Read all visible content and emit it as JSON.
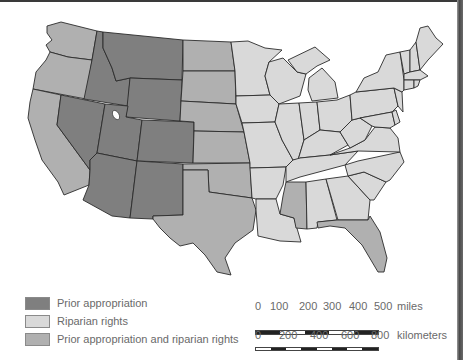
{
  "map": {
    "title": "Water rights doctrines of the United States",
    "colors": {
      "prior_appropriation": "#7f7f7f",
      "riparian_rights": "#d9d9d9",
      "mixed": "#b0b0b0",
      "border": "#2b2b2b"
    },
    "categories": {
      "prior_appropriation": [
        "Montana",
        "Idaho",
        "Wyoming",
        "Nevada",
        "Utah",
        "Colorado",
        "Arizona",
        "New Mexico"
      ],
      "mixed": [
        "Washington",
        "Oregon",
        "California",
        "North Dakota",
        "South Dakota",
        "Nebraska",
        "Kansas",
        "Oklahoma",
        "Texas",
        "Mississippi",
        "Florida"
      ],
      "riparian_rights": [
        "Minnesota",
        "Iowa",
        "Missouri",
        "Arkansas",
        "Louisiana",
        "Wisconsin",
        "Illinois",
        "Michigan",
        "Indiana",
        "Ohio",
        "Kentucky",
        "Tennessee",
        "Alabama",
        "Georgia",
        "South Carolina",
        "North Carolina",
        "Virginia",
        "West Virginia",
        "Pennsylvania",
        "New York",
        "Maryland",
        "Delaware",
        "New Jersey",
        "Connecticut",
        "Rhode Island",
        "Massachusetts",
        "Vermont",
        "New Hampshire",
        "Maine"
      ]
    }
  },
  "legend": {
    "items": [
      {
        "label": "Prior appropriation",
        "key": "prior_appropriation"
      },
      {
        "label": "Riparian rights",
        "key": "riparian_rights"
      },
      {
        "label": "Prior appropriation and riparian rights",
        "key": "mixed"
      }
    ]
  },
  "scale": {
    "miles": {
      "ticks": [
        "0",
        "100",
        "200",
        "300",
        "400",
        "500"
      ],
      "unit": "miles"
    },
    "kilometers": {
      "ticks": [
        "0",
        "200",
        "400",
        "600",
        "800"
      ],
      "unit": "kilometers"
    }
  }
}
